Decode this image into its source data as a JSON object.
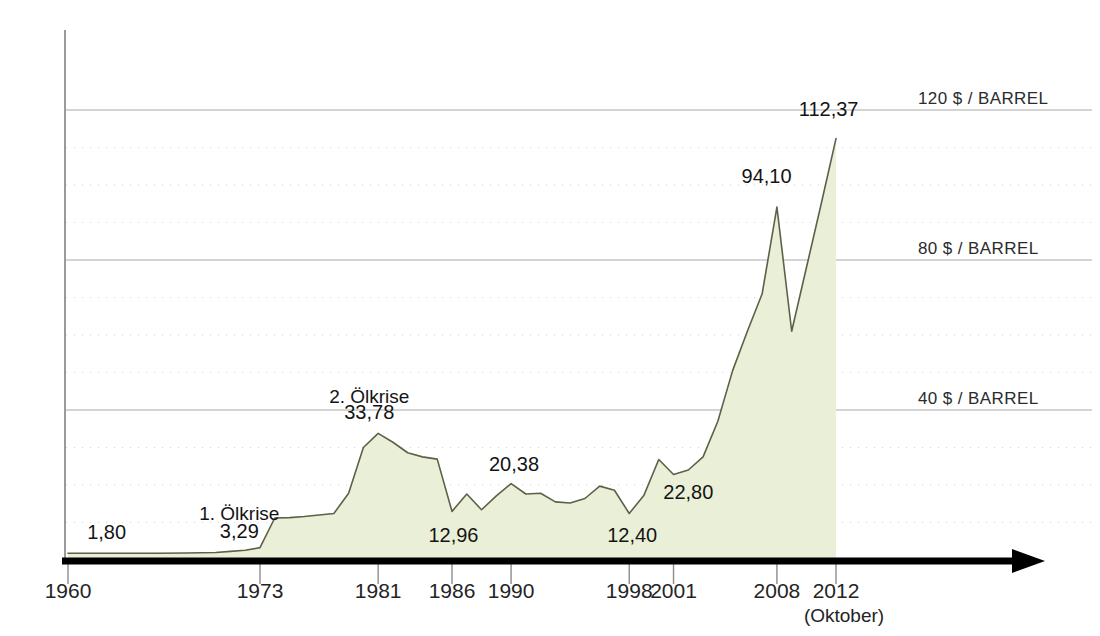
{
  "chart_data": {
    "type": "area",
    "title": "",
    "subtitle": "",
    "xlabel": "",
    "ylabel": "",
    "unit": "$ / BARREL",
    "xlim": [
      1960,
      2012.8
    ],
    "ylim": [
      0,
      130
    ],
    "grid": "horizontal major at 40/80/120, dotted minor every 10",
    "legend": "none",
    "x_tick_labels": [
      "1960",
      "1973",
      "1981",
      "1986",
      "1990",
      "1998",
      "2001",
      "2008",
      "2012"
    ],
    "x_tick_values": [
      1960,
      1973,
      1981,
      1986,
      1990,
      1998,
      2001,
      2008,
      2012
    ],
    "x_tick_sublabel": "(Oktober)",
    "y_axis_labels": [
      {
        "value": 120,
        "text": "120 $ / BARREL"
      },
      {
        "value": 80,
        "text": "80 $ / BARREL"
      },
      {
        "value": 40,
        "text": "40 $ / BARREL"
      }
    ],
    "annotations": [
      {
        "text": "1,80",
        "x": 1960,
        "y": 1.8,
        "label_x": 1961.3,
        "label_y": 5.5,
        "anchor": "start"
      },
      {
        "text": "1. Ölkrise",
        "x": 1973,
        "y": 3.29,
        "label_x": 1971.6,
        "label_y": 10.6,
        "kind": "event"
      },
      {
        "text": "3,29",
        "x": 1973,
        "y": 3.29,
        "label_x": 1971.6,
        "label_y": 6.0
      },
      {
        "text": "2. Ölkrise",
        "x": 1981,
        "y": 33.78,
        "label_x": 1980.4,
        "label_y": 42.0,
        "kind": "event"
      },
      {
        "text": "33,78",
        "x": 1981,
        "y": 33.78,
        "label_x": 1980.4,
        "label_y": 37.5
      },
      {
        "text": "12,96",
        "x": 1986,
        "y": 12.96,
        "label_x": 1986.1,
        "label_y": 4.8
      },
      {
        "text": "20,38",
        "x": 1990,
        "y": 20.38,
        "label_x": 1990.2,
        "label_y": 23.8
      },
      {
        "text": "12,40",
        "x": 1998,
        "y": 12.4,
        "label_x": 1998.2,
        "label_y": 4.8
      },
      {
        "text": "22,80",
        "x": 2001,
        "y": 22.8,
        "label_x": 2002.0,
        "label_y": 16.3
      },
      {
        "text": "94,10",
        "x": 2008,
        "y": 94.1,
        "label_x": 2007.3,
        "label_y": 100.5
      },
      {
        "text": "112,37",
        "x": 2012,
        "y": 112.37,
        "label_x": 2011.5,
        "label_y": 118.5
      }
    ],
    "series": [
      {
        "name": "Rohölpreis",
        "color": "#eaf0d8",
        "line_color": "#5c6148",
        "points": [
          [
            1960,
            1.8
          ],
          [
            1962,
            1.8
          ],
          [
            1964,
            1.8
          ],
          [
            1966,
            1.8
          ],
          [
            1968,
            1.85
          ],
          [
            1970,
            2.0
          ],
          [
            1971,
            2.3
          ],
          [
            1972,
            2.6
          ],
          [
            1973,
            3.29
          ],
          [
            1974,
            11.2
          ],
          [
            1975,
            11.3
          ],
          [
            1976,
            11.6
          ],
          [
            1977,
            12.0
          ],
          [
            1978,
            12.4
          ],
          [
            1979,
            17.8
          ],
          [
            1980,
            30.0
          ],
          [
            1981,
            33.78
          ],
          [
            1982,
            31.4
          ],
          [
            1983,
            28.6
          ],
          [
            1984,
            27.5
          ],
          [
            1985,
            26.9
          ],
          [
            1986,
            12.96
          ],
          [
            1987,
            17.6
          ],
          [
            1988,
            13.4
          ],
          [
            1989,
            17.1
          ],
          [
            1990,
            20.38
          ],
          [
            1991,
            17.6
          ],
          [
            1992,
            17.8
          ],
          [
            1993,
            15.5
          ],
          [
            1994,
            15.2
          ],
          [
            1995,
            16.4
          ],
          [
            1996,
            19.7
          ],
          [
            1997,
            18.6
          ],
          [
            1998,
            12.4
          ],
          [
            1999,
            17.3
          ],
          [
            2000,
            26.8
          ],
          [
            2001,
            22.8
          ],
          [
            2002,
            24.0
          ],
          [
            2003,
            27.5
          ],
          [
            2004,
            37.0
          ],
          [
            2005,
            50.5
          ],
          [
            2006,
            61.0
          ],
          [
            2007,
            71.0
          ],
          [
            2008,
            94.1
          ],
          [
            2009,
            61.0
          ],
          [
            2010,
            78.0
          ],
          [
            2011,
            95.0
          ],
          [
            2012,
            112.37
          ]
        ]
      }
    ]
  },
  "axis": {
    "arrow_name": "x-axis-arrow"
  }
}
